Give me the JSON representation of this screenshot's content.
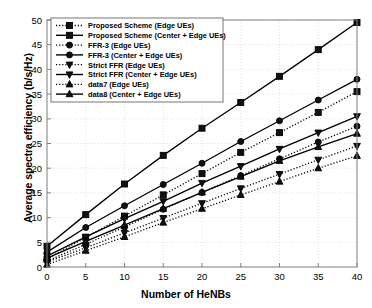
{
  "chart_data": {
    "type": "line",
    "title": "",
    "xlabel": "Number of HeNBs",
    "ylabel": "Average spectra efficiency (b/s/Hz)",
    "x": [
      0,
      5,
      10,
      15,
      20,
      25,
      30,
      35,
      40
    ],
    "xlim": [
      0,
      40
    ],
    "ylim": [
      0,
      50
    ],
    "xticks": [
      "0",
      "5",
      "10",
      "15",
      "20",
      "25",
      "30",
      "35",
      "40"
    ],
    "yticks": [
      "0",
      "5",
      "10",
      "15",
      "20",
      "25",
      "30",
      "35",
      "40",
      "45",
      "50"
    ],
    "grid": true,
    "legend_position": "upper-left",
    "series": [
      {
        "name": "Proposed Scheme (Edge UEs)",
        "style": "dotted",
        "marker": "square",
        "values": [
          1.6,
          6.0,
          10.3,
          14.6,
          18.9,
          23.2,
          27.2,
          31.3,
          35.5
        ]
      },
      {
        "name": "Proposed Scheme (Center + Edge UEs)",
        "style": "solid",
        "marker": "square",
        "values": [
          4.2,
          10.6,
          16.8,
          22.6,
          28.1,
          33.3,
          38.6,
          44.0,
          49.5
        ]
      },
      {
        "name": "FFR-3 (Edge UEs)",
        "style": "dotted",
        "marker": "circle",
        "values": [
          1.2,
          4.6,
          8.1,
          11.7,
          15.1,
          18.5,
          21.9,
          25.3,
          28.5
        ]
      },
      {
        "name": "FFR-3 (Center + Edge UEs)",
        "style": "solid",
        "marker": "circle",
        "values": [
          3.0,
          8.0,
          12.4,
          16.7,
          21.0,
          25.4,
          29.6,
          33.8,
          38.0
        ]
      },
      {
        "name": "Strict FFR (Edge UEs)",
        "style": "dotted",
        "marker": "triangle-down",
        "values": [
          1.0,
          3.9,
          6.9,
          9.9,
          12.9,
          15.9,
          18.8,
          21.7,
          24.5
        ]
      },
      {
        "name": "Strict FFR (Center + Edge UEs)",
        "style": "solid",
        "marker": "triangle-down",
        "values": [
          2.2,
          6.1,
          9.8,
          13.3,
          17.0,
          20.4,
          23.9,
          27.2,
          30.5
        ]
      },
      {
        "name": "data7 (Edge UEs)",
        "style": "dotted",
        "marker": "triangle-up",
        "values": [
          0.5,
          3.3,
          6.1,
          9.0,
          11.8,
          14.6,
          17.3,
          20.0,
          22.5
        ]
      },
      {
        "name": "data8 (Center + Edge UEs)",
        "style": "solid",
        "marker": "triangle-up",
        "values": [
          1.8,
          5.2,
          8.5,
          11.8,
          15.1,
          18.3,
          21.5,
          24.3,
          27.0
        ]
      }
    ],
    "colors": {
      "line": "#000000",
      "grid": "#d9d9d9",
      "axis": "#808080",
      "background": "#ffffff"
    }
  }
}
